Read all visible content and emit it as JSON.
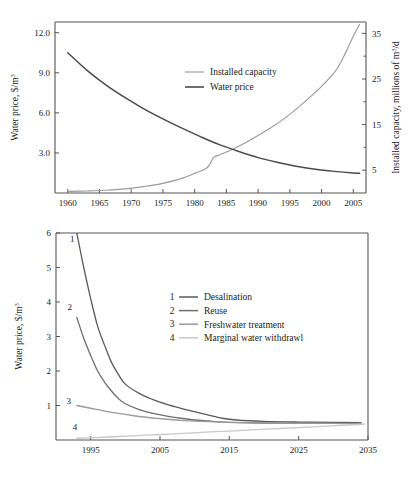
{
  "figure": {
    "title": "",
    "panels": [
      "top-chart",
      "bottom-chart"
    ]
  },
  "colors": {
    "water_price": "#4a4a4a",
    "installed_capacity": "#9a9a9a",
    "desalination": "#5a5a5a",
    "reuse": "#6e6e6e",
    "freshwater_treatment": "#9a9a9a",
    "marginal_withdrawl": "#c8c8c8",
    "axis": "#555555",
    "text": "#1a1a1a"
  },
  "chart_data": [
    {
      "id": "top-chart",
      "type": "line",
      "title": "",
      "xlabel": "",
      "ylabel": "Water price, $/m",
      "ylabel_sup": "3",
      "y2label": "Installed capacity, millions of m",
      "y2label_sup": "3",
      "y2label_tail": "/d",
      "xlim": [
        1958,
        2007
      ],
      "ylim": [
        0,
        12.8
      ],
      "y2lim": [
        0,
        37.5
      ],
      "grid": false,
      "legend_position": "upper-center",
      "xticks": [
        1960,
        1965,
        1970,
        1975,
        1980,
        1985,
        1990,
        1995,
        2000,
        2005
      ],
      "xtick_labels": [
        "1960",
        "1965",
        "1970",
        "1975",
        "1980",
        "1985",
        "1990",
        "1995",
        "2000",
        "2005"
      ],
      "yticks": [
        3.0,
        6.0,
        9.0,
        12.0
      ],
      "ytick_labels": [
        "3.0",
        "6.0",
        "9.0",
        "12.0"
      ],
      "y2ticks": [
        5,
        15,
        25,
        35
      ],
      "y2ticks_minor": [
        10,
        20,
        30
      ],
      "y2tick_labels": [
        "5",
        "15",
        "25",
        "35"
      ],
      "series": [
        {
          "name": "Installed capacity",
          "axis": "right",
          "color": "#9a9a9a",
          "x": [
            1960,
            1963,
            1966,
            1969,
            1972,
            1975,
            1978,
            1980,
            1982,
            1983,
            1984,
            1986,
            1988,
            1990,
            1992,
            1994,
            1996,
            1998,
            2000,
            2002,
            2003,
            2004,
            2005,
            2006
          ],
          "values": [
            0.35,
            0.45,
            0.6,
            0.9,
            1.4,
            2.1,
            3.2,
            4.3,
            5.6,
            7.8,
            8.4,
            9.6,
            11.0,
            12.6,
            14.3,
            16.2,
            18.4,
            20.8,
            23.4,
            26.4,
            28.6,
            31.4,
            34.4,
            37.0
          ]
        },
        {
          "name": "Water price",
          "axis": "left",
          "color": "#4a4a4a",
          "x": [
            1960,
            1963,
            1966,
            1969,
            1972,
            1975,
            1978,
            1981,
            1984,
            1987,
            1990,
            1993,
            1996,
            1999,
            2002,
            2005,
            2006
          ],
          "values": [
            10.5,
            9.2,
            8.1,
            7.15,
            6.3,
            5.55,
            4.85,
            4.2,
            3.6,
            3.1,
            2.65,
            2.3,
            2.0,
            1.78,
            1.62,
            1.5,
            1.48
          ]
        }
      ],
      "legend": [
        {
          "label": "Installed capacity",
          "color": "#9a9a9a"
        },
        {
          "label": "Water price",
          "color": "#4a4a4a"
        }
      ]
    },
    {
      "id": "bottom-chart",
      "type": "line",
      "title": "",
      "xlabel": "",
      "ylabel": "Water price, $/m",
      "ylabel_sup": "3",
      "xlim": [
        1990,
        2035
      ],
      "ylim": [
        0,
        6
      ],
      "grid": false,
      "legend_position": "upper-center",
      "xticks": [
        1995,
        2005,
        2015,
        2025,
        2035
      ],
      "xtick_labels": [
        "1995",
        "2005",
        "2015",
        "2025",
        "2035"
      ],
      "yticks": [
        1,
        2,
        3,
        4,
        5,
        6
      ],
      "ytick_labels": [
        "1",
        "2",
        "3",
        "4",
        "5",
        "6"
      ],
      "series": [
        {
          "name": "Desalination",
          "tag": "1",
          "color": "#5a5a5a",
          "x": [
            1993.0,
            1994,
            1995,
            1996,
            1997,
            1998,
            1999,
            2000,
            2002,
            2004,
            2006,
            2008,
            2010,
            2012,
            2014,
            2016,
            2020,
            2025,
            2030,
            2034
          ],
          "values": [
            6.0,
            5.0,
            4.1,
            3.3,
            2.75,
            2.25,
            1.9,
            1.62,
            1.35,
            1.17,
            1.03,
            0.92,
            0.82,
            0.72,
            0.63,
            0.58,
            0.54,
            0.52,
            0.51,
            0.5
          ]
        },
        {
          "name": "Reuse",
          "tag": "2",
          "color": "#6e6e6e",
          "x": [
            1993.0,
            1994,
            1995,
            1996,
            1997,
            1998,
            1999,
            2000,
            2002,
            2004,
            2006,
            2008,
            2010,
            2012,
            2014,
            2018,
            2022,
            2026,
            2030,
            2034
          ],
          "values": [
            3.55,
            2.95,
            2.45,
            2.0,
            1.68,
            1.42,
            1.2,
            1.05,
            0.88,
            0.77,
            0.69,
            0.63,
            0.58,
            0.55,
            0.52,
            0.5,
            0.49,
            0.49,
            0.49,
            0.49
          ]
        },
        {
          "name": "Freshwater treatment",
          "tag": "3",
          "color": "#9a9a9a",
          "x": [
            1993.0,
            1995,
            1997,
            1999,
            2001,
            2003,
            2005,
            2008,
            2011,
            2014,
            2018,
            2022,
            2026,
            2030,
            2034
          ],
          "values": [
            1.0,
            0.92,
            0.84,
            0.77,
            0.71,
            0.66,
            0.62,
            0.57,
            0.54,
            0.52,
            0.5,
            0.49,
            0.48,
            0.48,
            0.47
          ]
        },
        {
          "name": "Marginal water withdrawl",
          "tag": "4",
          "color": "#c8c8c8",
          "x": [
            1993.0,
            1997,
            2001,
            2005,
            2009,
            2013,
            2017,
            2021,
            2025,
            2029,
            2033,
            2034.5
          ],
          "values": [
            0.05,
            0.08,
            0.12,
            0.16,
            0.2,
            0.24,
            0.28,
            0.32,
            0.36,
            0.4,
            0.44,
            0.46
          ]
        }
      ],
      "legend": [
        {
          "tag": "1",
          "label": "Desalination",
          "color": "#5a5a5a"
        },
        {
          "tag": "2",
          "label": "Reuse",
          "color": "#6e6e6e"
        },
        {
          "tag": "3",
          "label": "Freshwater treatment",
          "color": "#9a9a9a"
        },
        {
          "tag": "4",
          "label": "Marginal water withdrawl",
          "color": "#c8c8c8"
        }
      ]
    }
  ]
}
